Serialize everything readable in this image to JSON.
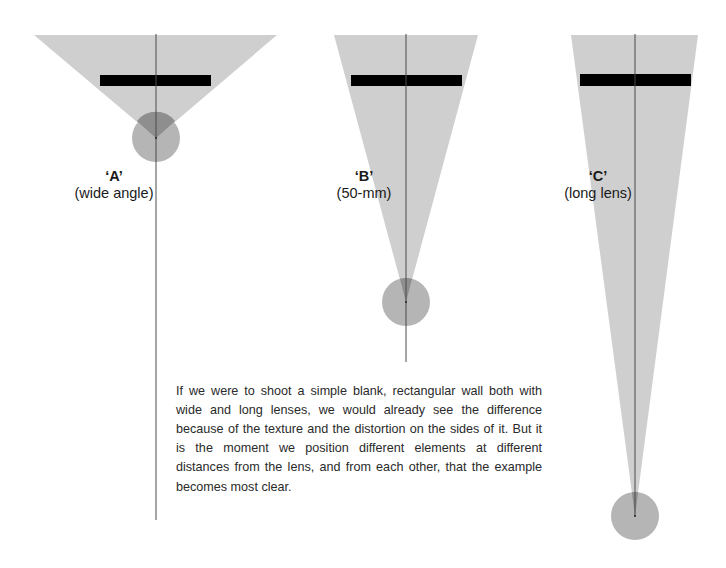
{
  "colors": {
    "field_of_view": "#cfcfcf",
    "lens_circle": "#a8a8a8",
    "overlap": "#8c8c8c",
    "subject_bar": "#000000",
    "axis_line": "#4a4a4a",
    "text": "#1a1a1a"
  },
  "lenses": [
    {
      "id": "A",
      "letter": "‘A’",
      "description": "(wide angle)"
    },
    {
      "id": "B",
      "letter": "‘B’",
      "description": "(50-mm)"
    },
    {
      "id": "C",
      "letter": "‘C’",
      "description": "(long lens)"
    }
  ],
  "caption": "If we were to shoot a simple blank, rectangular wall both with wide and long lenses, we would already see the difference because of the texture and the distortion on the sides of it. But it is the moment we position different elements at different distances from the lens, and from each other, that the example becomes most clear."
}
